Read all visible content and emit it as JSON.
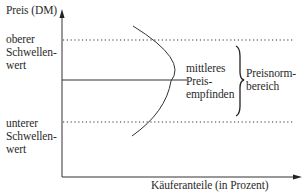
{
  "y_axis": {
    "label": "Preis (DM)"
  },
  "x_axis": {
    "label": "Käuferanteile (in Prozent)"
  },
  "upper_threshold": {
    "line1": "oberer",
    "line2": "Schwellen-",
    "line3": "wert"
  },
  "lower_threshold": {
    "line1": "unterer",
    "line2": "Schwellen-",
    "line3": "wert"
  },
  "middle": {
    "line1": "mittleres",
    "line2": "Preis-",
    "line3": "empfinden"
  },
  "range": {
    "line1": "Preisnorm-",
    "line2": "bereich"
  },
  "colors": {
    "line": "#333333",
    "text": "#2a2a2a"
  }
}
